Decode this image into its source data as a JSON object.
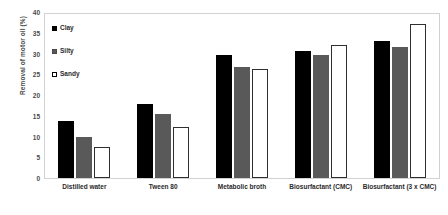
{
  "chart_data": {
    "type": "bar",
    "title": "",
    "xlabel": "",
    "ylabel": "Removal of motor oil (%)",
    "ylim": [
      0,
      40
    ],
    "ytick_step": 5,
    "yticks": [
      40,
      35,
      30,
      25,
      20,
      15,
      10,
      5,
      0
    ],
    "grid": false,
    "legend_position": "top-left inside plot",
    "categories": [
      "Distilled water",
      "Tween 80",
      "Metabolic broth",
      "Biosurfactant (CMC)",
      "Biosurfactant (3 x CMC)"
    ],
    "series": [
      {
        "name": "Clay",
        "color": "#000000",
        "values": [
          14.0,
          18.0,
          30.0,
          31.0,
          33.5
        ]
      },
      {
        "name": "Silty",
        "color": "#595959",
        "values": [
          10.0,
          15.5,
          27.0,
          30.0,
          32.0
        ]
      },
      {
        "name": "Sandy",
        "color": "#ffffff",
        "values": [
          7.5,
          12.5,
          26.5,
          32.5,
          37.5
        ]
      }
    ]
  },
  "legend": {
    "items": [
      {
        "label": "Clay",
        "swatch": "legend-swatch-black-filled"
      },
      {
        "label": "Silty",
        "swatch": "legend-swatch-gray-filled"
      },
      {
        "label": "Sandy",
        "swatch": "legend-swatch-white-open"
      }
    ]
  },
  "colors": {
    "clay": "#000000",
    "silty": "#595959",
    "sandy": "#ffffff",
    "frame": "#d2d2d2",
    "text": "#2b2b2b",
    "axis_text": "#4a4a4a"
  }
}
